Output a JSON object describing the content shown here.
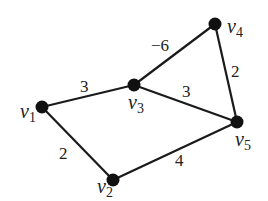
{
  "graph": {
    "type": "weighted-undirected-graph",
    "nodes": [
      {
        "id": "v1",
        "label": "v",
        "sub": "1",
        "x": 42,
        "y": 107,
        "lx": 20,
        "ly": 118
      },
      {
        "id": "v2",
        "label": "v",
        "sub": "2",
        "x": 113,
        "y": 180,
        "lx": 97,
        "ly": 193
      },
      {
        "id": "v3",
        "label": "v",
        "sub": "3",
        "x": 134,
        "y": 85,
        "lx": 128,
        "ly": 109
      },
      {
        "id": "v4",
        "label": "v",
        "sub": "4",
        "x": 215,
        "y": 24,
        "lx": 227,
        "ly": 33
      },
      {
        "id": "v5",
        "label": "v",
        "sub": "5",
        "x": 237,
        "y": 122,
        "lx": 235,
        "ly": 146
      }
    ],
    "edges": [
      {
        "from": "v1",
        "to": "v3",
        "weight": "3",
        "wx": 80,
        "wy": 92
      },
      {
        "from": "v3",
        "to": "v4",
        "weight": "−6",
        "wx": 151,
        "wy": 51
      },
      {
        "from": "v3",
        "to": "v5",
        "weight": "3",
        "wx": 182,
        "wy": 97
      },
      {
        "from": "v4",
        "to": "v5",
        "weight": "2",
        "wx": 231,
        "wy": 77
      },
      {
        "from": "v1",
        "to": "v2",
        "weight": "2",
        "wx": 59,
        "wy": 159
      },
      {
        "from": "v2",
        "to": "v5",
        "weight": "4",
        "wx": 175,
        "wy": 166
      }
    ]
  }
}
